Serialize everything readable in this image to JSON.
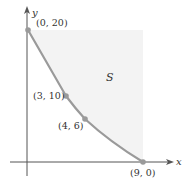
{
  "diagram": {
    "axes": {
      "x_label": "x",
      "y_label": "y"
    },
    "region_label": "S",
    "points": [
      {
        "label": "(0, 20)",
        "x": 0,
        "y": 20
      },
      {
        "label": "(3, 10)",
        "x": 3,
        "y": 10
      },
      {
        "label": "(4, 6)",
        "x": 4,
        "y": 6
      },
      {
        "label": "(9, 0)",
        "x": 9,
        "y": 0
      }
    ],
    "colors": {
      "curve": "#9a9a9a",
      "region_fill": "#f3f3f3",
      "axes": "#555555",
      "point": "#9a9a9a"
    }
  }
}
